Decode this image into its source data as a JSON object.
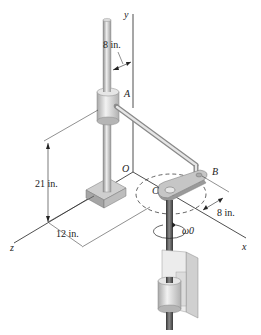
{
  "figure": {
    "axes": {
      "x": "x",
      "y": "y",
      "z": "z",
      "origin": "O"
    },
    "points": {
      "A": "A",
      "B": "B",
      "C": "C"
    },
    "dimensions": {
      "top_offset": "8 in.",
      "height": "21 in.",
      "z_offset": "12 in.",
      "x_offset": "8 in."
    },
    "angular_velocity": "ω0"
  },
  "colors": {
    "line": "#222222",
    "metal_light": "#e4e4e4",
    "metal_mid": "#b8b8b8",
    "metal_dark": "#7a7a7a",
    "shaft_dark": "#4a4a4a"
  }
}
